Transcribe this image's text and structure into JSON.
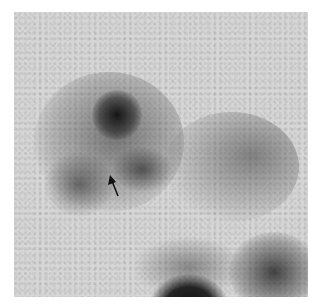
{
  "image": {
    "description": "Grayscale nuclear medicine scintigraphy scan showing dark radiotracer uptake regions on a light gray background",
    "annotations": [
      {
        "type": "arrow",
        "direction": "up-left",
        "tip": [
          110,
          176
        ],
        "tail": [
          118,
          196
        ],
        "color": "#111111"
      }
    ],
    "colors": {
      "background": "#d6d6d6",
      "border": "#ffffff",
      "uptake_dark": "#1a1a1a"
    }
  }
}
